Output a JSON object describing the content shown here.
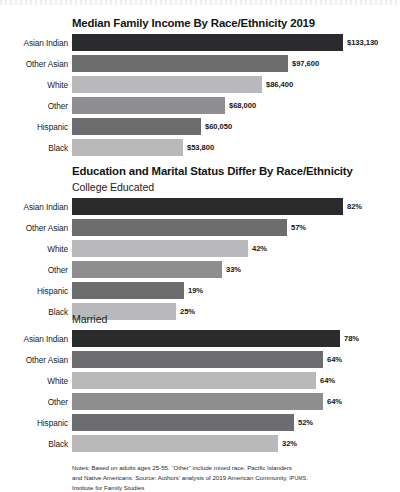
{
  "colors": {
    "bar_dark": "#2b2b2e",
    "bar_mid_dark": "#6d6d70",
    "bar_light": "#b9b9bb",
    "bar_mid": "#8e8e90",
    "background": "#ffffff",
    "text": "#1a1a1a"
  },
  "chart_data": [
    {
      "type": "bar",
      "title": "Median Family Income By Race/Ethnicity 2019",
      "subtitle": "",
      "orientation": "horizontal",
      "xlabel": "",
      "ylabel": "",
      "categories": [
        "Asian Indian",
        "Other Asian",
        "White",
        "Other",
        "Hispanic",
        "Black"
      ],
      "values": [
        133130,
        97600,
        86400,
        68000,
        60050,
        53800
      ],
      "value_labels": [
        "$133,130",
        "$97,600",
        "$86,400",
        "$68,000",
        "$60,050",
        "$53,800"
      ],
      "bar_pixel_widths": [
        271,
        216,
        190,
        153,
        129,
        111
      ],
      "bar_colors": [
        "#2b2b2e",
        "#6d6d70",
        "#b9b9bb",
        "#8e8e90",
        "#6d6d70",
        "#b9b9bb"
      ],
      "grid": false,
      "legend": "none"
    },
    {
      "type": "bar",
      "title": "Education and Marital Status Differ By Race/Ethnicity",
      "subtitle": "College Educated",
      "orientation": "horizontal",
      "xlabel": "",
      "ylabel": "",
      "categories": [
        "Asian Indian",
        "Other Asian",
        "White",
        "Other",
        "Hispanic",
        "Black"
      ],
      "values": [
        82,
        57,
        42,
        33,
        19,
        25
      ],
      "value_labels": [
        "82%",
        "57%",
        "42%",
        "33%",
        "19%",
        "25%"
      ],
      "bar_pixel_widths": [
        271,
        215,
        176,
        150,
        112,
        104
      ],
      "bar_colors": [
        "#2b2b2e",
        "#6d6d70",
        "#b9b9bb",
        "#8e8e90",
        "#6d6d70",
        "#b9b9bb"
      ],
      "grid": false,
      "legend": "none"
    },
    {
      "type": "bar",
      "title": "",
      "subtitle": "Married",
      "orientation": "horizontal",
      "xlabel": "",
      "ylabel": "",
      "categories": [
        "Asian Indian",
        "Other Asian",
        "White",
        "Other",
        "Hispanic",
        "Black"
      ],
      "values": [
        78,
        64,
        58,
        64,
        52,
        32
      ],
      "value_labels": [
        "78%",
        "64%",
        "64%",
        "64%",
        "52%",
        "32%"
      ],
      "bar_pixel_widths": [
        268,
        251,
        244,
        251,
        222,
        206
      ],
      "bar_colors": [
        "#2b2b2e",
        "#6d6d70",
        "#b9b9bb",
        "#8e8e90",
        "#6d6d70",
        "#b9b9bb"
      ],
      "grid": false,
      "legend": "none"
    }
  ],
  "chart1": {
    "title": "Median Family Income By Race/Ethnicity 2019",
    "rows": [
      {
        "label": "Asian Indian",
        "value": "$133,130"
      },
      {
        "label": "Other Asian",
        "value": "$97,600"
      },
      {
        "label": "White",
        "value": "$86,400"
      },
      {
        "label": "Other",
        "value": "$68,000"
      },
      {
        "label": "Hispanic",
        "value": "$60,050"
      },
      {
        "label": "Black",
        "value": "$53,800"
      }
    ]
  },
  "chart2": {
    "title": "Education and Marital Status Differ By Race/Ethnicity",
    "subtitle": "College Educated",
    "rows": [
      {
        "label": "Asian Indian",
        "value": "82%"
      },
      {
        "label": "Other Asian",
        "value": "57%"
      },
      {
        "label": "White",
        "value": "42%"
      },
      {
        "label": "Other",
        "value": "33%"
      },
      {
        "label": "Hispanic",
        "value": "19%"
      },
      {
        "label": "Black",
        "value": "25%"
      }
    ]
  },
  "chart3": {
    "subtitle": "Married",
    "rows": [
      {
        "label": "Asian Indian",
        "value": "78%"
      },
      {
        "label": "Other Asian",
        "value": "64%"
      },
      {
        "label": "White",
        "value": "58%"
      },
      {
        "label": "Other",
        "value": "64%"
      },
      {
        "label": "Hispanic",
        "value": "52%"
      },
      {
        "label": "Black",
        "value": "32%"
      }
    ]
  },
  "notes": {
    "line1": "Notes: Based on adults ages 25-55. “Other” include mixed race, Pacific Islanders",
    "line2a": "and Native Americans. Source: Authors’ analysis of 2019 American Community, ",
    "line2b": "IPUMS.",
    "line3": "Institute for Family Studies"
  }
}
